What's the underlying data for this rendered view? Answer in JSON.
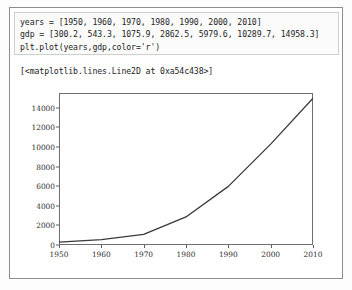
{
  "notebook": {
    "code_lines": [
      "years = [1950, 1960, 1970, 1980, 1990, 2000, 2010]",
      "gdp = [300.2, 543.3, 1075.9, 2862.5, 5979.6, 10289.7, 14958.3]",
      "plt.plot(years,gdp,color='r')"
    ],
    "output_text": "[<matplotlib.lines.Line2D at 0xa54c438>]"
  },
  "chart_data": {
    "type": "line",
    "title": "",
    "xlabel": "",
    "ylabel": "",
    "x": [
      1950,
      1960,
      1970,
      1980,
      1990,
      2000,
      2010
    ],
    "values": [
      300.2,
      543.3,
      1075.9,
      2862.5,
      5979.6,
      10289.7,
      14958.3
    ],
    "series": [
      {
        "name": "gdp",
        "color": "#3a3a3a",
        "declared_color": "r",
        "values": [
          300.2,
          543.3,
          1075.9,
          2862.5,
          5979.6,
          10289.7,
          14958.3
        ]
      }
    ],
    "xlim": [
      1950,
      2010
    ],
    "ylim": [
      0,
      15500
    ],
    "xticks": [
      1950,
      1960,
      1970,
      1980,
      1990,
      2000,
      2010
    ],
    "xtick_labels": [
      "1950",
      "1960",
      "1970",
      "1980",
      "1990",
      "2000",
      "2010"
    ],
    "yticks": [
      0,
      2000,
      4000,
      6000,
      8000,
      10000,
      12000,
      14000
    ],
    "ytick_labels": [
      "0",
      "2000",
      "4000",
      "6000",
      "8000",
      "10000",
      "12000",
      "14000"
    ],
    "grid": false,
    "legend": false
  },
  "colors": {
    "frame": "#8d8d8d",
    "code_cell_border": "#cfcfcf",
    "axis": "#6f6f6f",
    "line": "#3a3a3a",
    "text": "#242424"
  }
}
